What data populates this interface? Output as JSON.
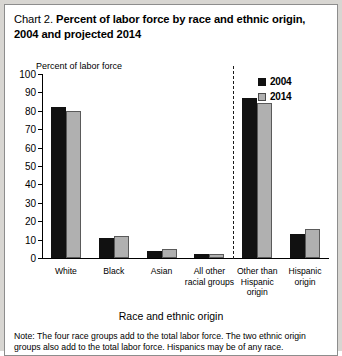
{
  "title": {
    "chart_number": "Chart 2.",
    "text": "Percent of labor force by race and ethnic origin, 2004 and projected 2014"
  },
  "axis_caption": "Percent of labor force",
  "xlabel": "Race and ethnic origin",
  "note": "Note: The four race groups add to the total labor force. The two ethnic origin groups also add to the total labor force. Hispanics may be of any race.",
  "legend": {
    "items": [
      {
        "label": "2004",
        "color": "#111111"
      },
      {
        "label": "2014",
        "color": "#b0b0b0"
      }
    ]
  },
  "chart_data": {
    "type": "bar",
    "title": "Chart 2. Percent of labor force by race and ethnic origin, 2004 and projected 2014",
    "xlabel": "Race and ethnic origin",
    "ylabel": "Percent of labor force",
    "ylim": [
      0,
      100
    ],
    "yticks": [
      0,
      10,
      20,
      30,
      40,
      50,
      60,
      70,
      80,
      90,
      100
    ],
    "grid": false,
    "legend_position": "top-right",
    "categories": [
      "White",
      "Black",
      "Asian",
      "All other racial groups",
      "Other than Hispanic origin",
      "Hispanic origin"
    ],
    "series": [
      {
        "name": "2004",
        "color": "#111111",
        "values": [
          82,
          11,
          4,
          2,
          87,
          13
        ]
      },
      {
        "name": "2014",
        "color": "#b0b0b0",
        "values": [
          80,
          12,
          5,
          2,
          84,
          16
        ]
      }
    ],
    "annotations": [
      "Dashed vertical divider separates race groups from ethnic origin groups"
    ]
  }
}
